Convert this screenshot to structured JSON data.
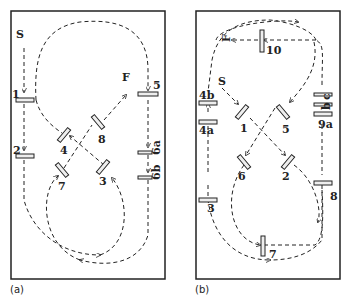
{
  "panels": [
    {
      "caption": "(a)",
      "start": "S",
      "finish": "F",
      "mirrors": [
        "1",
        "2",
        "3",
        "4",
        "5",
        "6a",
        "6b",
        "7",
        "8"
      ]
    },
    {
      "caption": "(b)",
      "start": "S",
      "finish": "F",
      "mirrors": [
        "1",
        "2",
        "3",
        "4a",
        "4b",
        "5",
        "6",
        "7",
        "8",
        "9a",
        "b",
        "c",
        "10"
      ]
    }
  ],
  "colors": {
    "line": "#222222",
    "background": "#ffffff"
  }
}
